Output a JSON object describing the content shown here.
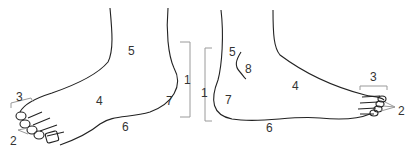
{
  "diagram": {
    "title": "",
    "colors": {
      "outline": "#222222",
      "bracket": "#9a9a9a",
      "label": "#333333"
    },
    "left_foot": {
      "labels": [
        {
          "id": "l5",
          "text": "5",
          "x": 128,
          "y": 45
        },
        {
          "id": "l4",
          "text": "4",
          "x": 96,
          "y": 95
        },
        {
          "id": "l7",
          "text": "7",
          "x": 166,
          "y": 95
        },
        {
          "id": "l1",
          "text": "1",
          "x": 184,
          "y": 74
        },
        {
          "id": "l6",
          "text": "6",
          "x": 122,
          "y": 121
        },
        {
          "id": "l3",
          "text": "3",
          "x": 16,
          "y": 91
        },
        {
          "id": "l2",
          "text": "2",
          "x": 10,
          "y": 135
        }
      ]
    },
    "right_foot": {
      "labels": [
        {
          "id": "r5",
          "text": "5",
          "x": 229,
          "y": 46
        },
        {
          "id": "r8",
          "text": "8",
          "x": 245,
          "y": 63
        },
        {
          "id": "r4",
          "text": "4",
          "x": 292,
          "y": 80
        },
        {
          "id": "r7",
          "text": "7",
          "x": 225,
          "y": 94
        },
        {
          "id": "r1",
          "text": "1",
          "x": 201,
          "y": 87
        },
        {
          "id": "r6",
          "text": "6",
          "x": 266,
          "y": 122
        },
        {
          "id": "r3",
          "text": "3",
          "x": 370,
          "y": 71
        },
        {
          "id": "r2",
          "text": "2",
          "x": 398,
          "y": 105
        }
      ]
    }
  }
}
